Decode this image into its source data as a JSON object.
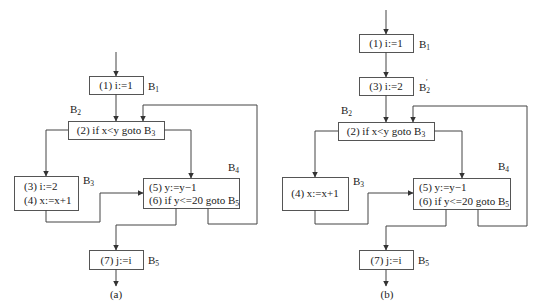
{
  "figures": [
    {
      "id": "a",
      "caption": "(a)",
      "blocks": {
        "B1": {
          "label": "B",
          "sub": "1",
          "lines": [
            "(1) i:=1"
          ]
        },
        "B2": {
          "label": "B",
          "sub": "2",
          "lines": [
            "(2) if x<y goto B"
          ],
          "line_sub": "3"
        },
        "B3": {
          "label": "B",
          "sub": "3",
          "lines": [
            "(3) i:=2",
            "(4) x:=x+1"
          ]
        },
        "B4": {
          "label": "B",
          "sub": "4",
          "lines": [
            "(5) y:=y−1",
            "(6) if y<=20 goto B"
          ],
          "line_sub": "5"
        },
        "B5": {
          "label": "B",
          "sub": "5",
          "lines": [
            "(7) j:=i"
          ]
        }
      }
    },
    {
      "id": "b",
      "caption": "(b)",
      "blocks": {
        "B1": {
          "label": "B",
          "sub": "1",
          "lines": [
            "(1) i:=1"
          ]
        },
        "B2p": {
          "label": "B",
          "sub": "2",
          "prime": "′",
          "lines": [
            "(3) i:=2"
          ]
        },
        "B2": {
          "label": "B",
          "sub": "2",
          "lines": [
            "(2) if x<y goto B"
          ],
          "line_sub": "3"
        },
        "B3": {
          "label": "B",
          "sub": "3",
          "lines": [
            "(4) x:=x+1"
          ]
        },
        "B4": {
          "label": "B",
          "sub": "4",
          "lines": [
            "(5) y:=y−1",
            "(6) if y<=20 goto B"
          ],
          "line_sub": "5"
        },
        "B5": {
          "label": "B",
          "sub": "5",
          "lines": [
            "(7) j:=i"
          ]
        }
      }
    }
  ]
}
